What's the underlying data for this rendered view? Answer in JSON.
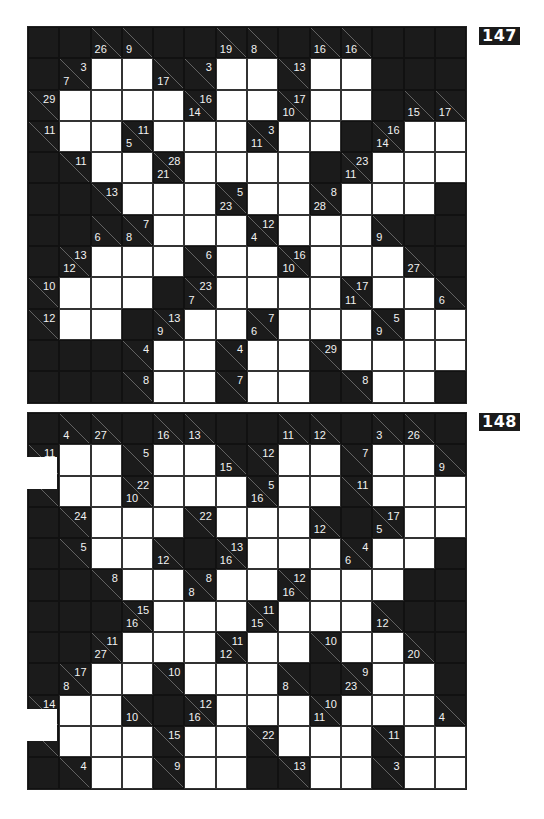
{
  "puzzles": [
    {
      "number": "147",
      "cols": 14,
      "rows": 12,
      "cells": [
        [
          "B",
          "B",
          "26/",
          "9/",
          "B",
          "B",
          "19/",
          "8/",
          "B",
          "16/",
          "16/",
          "B",
          "B",
          "B"
        ],
        [
          "B",
          "7/3",
          "W",
          "W",
          "17/",
          "/3",
          "W",
          "W",
          "/13",
          "W",
          "W",
          "B",
          "B",
          "B"
        ],
        [
          "/29",
          "W",
          "W",
          "W",
          "W",
          "14/16",
          "W",
          "W",
          "10/17",
          "W",
          "W",
          "B",
          "15/",
          "17/"
        ],
        [
          "/11",
          "W",
          "W",
          "5/11",
          "W",
          "W",
          "W",
          "11/3",
          "W",
          "W",
          "B",
          "14/16",
          "W",
          "W"
        ],
        [
          "B",
          "/11",
          "W",
          "W",
          "21/28",
          "W",
          "W",
          "W",
          "W",
          "B",
          "11/23",
          "W",
          "W",
          "W"
        ],
        [
          "B",
          "B",
          "/13",
          "W",
          "W",
          "W",
          "23/5",
          "W",
          "W",
          "28/8",
          "W",
          "W",
          "W",
          "B"
        ],
        [
          "B",
          "B",
          "6/",
          "8/7",
          "W",
          "W",
          "W",
          "4/12",
          "W",
          "W",
          "W",
          "9/",
          "B",
          "B"
        ],
        [
          "B",
          "12/13",
          "W",
          "W",
          "W",
          "/6",
          "W",
          "W",
          "10/16",
          "W",
          "W",
          "W",
          "27/",
          "B"
        ],
        [
          "/10",
          "W",
          "W",
          "W",
          "B",
          "7/23",
          "W",
          "W",
          "W",
          "W",
          "11/17",
          "W",
          "W",
          "6/"
        ],
        [
          "/12",
          "W",
          "W",
          "B",
          "9/13",
          "W",
          "W",
          "6/7",
          "W",
          "W",
          "W",
          "9/5",
          "W",
          "W"
        ],
        [
          "B",
          "B",
          "B",
          "/4",
          "W",
          "W",
          "/4",
          "W",
          "W",
          "/29",
          "W",
          "W",
          "W",
          "W"
        ],
        [
          "B",
          "B",
          "B",
          "/8",
          "W",
          "W",
          "/7",
          "W",
          "W",
          "B",
          "/8",
          "W",
          "W",
          "B"
        ]
      ]
    },
    {
      "number": "148",
      "cols": 14,
      "rows": 12,
      "cells": [
        [
          "B",
          "4/",
          "27/",
          "B",
          "16/",
          "13/",
          "B",
          "B",
          "11/",
          "12/",
          "B",
          "3/",
          "26/",
          "B"
        ],
        [
          "/11",
          "W",
          "W",
          "/5",
          "W",
          "W",
          "15/",
          "/12",
          "W",
          "W",
          "/7",
          "W",
          "W",
          "9/"
        ],
        [
          "/",
          "W",
          "W",
          "10/22",
          "W",
          "W",
          "W",
          "16/5",
          "W",
          "W",
          "/11",
          "W",
          "W",
          "W"
        ],
        [
          "B",
          "/24",
          "W",
          "W",
          "W",
          "/22",
          "W",
          "W",
          "W",
          "12/",
          "B",
          "5/17",
          "W",
          "W"
        ],
        [
          "B",
          "/5",
          "W",
          "W",
          "12/",
          "B",
          "16/13",
          "W",
          "W",
          "W",
          "6/4",
          "W",
          "W",
          "B"
        ],
        [
          "B",
          "B",
          "/8",
          "W",
          "W",
          "8/8",
          "W",
          "W",
          "16/12",
          "W",
          "W",
          "W",
          "B",
          "B"
        ],
        [
          "B",
          "B",
          "B",
          "16/15",
          "W",
          "W",
          "W",
          "15/11",
          "W",
          "W",
          "W",
          "12/",
          "B",
          "B"
        ],
        [
          "B",
          "B",
          "27/11",
          "W",
          "W",
          "W",
          "12/11",
          "W",
          "W",
          "/10",
          "W",
          "W",
          "20/",
          "B"
        ],
        [
          "B",
          "8/17",
          "W",
          "W",
          "/10",
          "W",
          "W",
          "W",
          "8/",
          "B",
          "23/9",
          "W",
          "W",
          "B"
        ],
        [
          "/14",
          "W",
          "W",
          "10/",
          "B",
          "16/12",
          "W",
          "W",
          "W",
          "11/10",
          "W",
          "W",
          "W",
          "4/"
        ],
        [
          "/",
          "W",
          "W",
          "W",
          "/15",
          "W",
          "W",
          "/22",
          "W",
          "W",
          "W",
          "/11",
          "W",
          "W"
        ],
        [
          "B",
          "/4",
          "W",
          "W",
          "/9",
          "W",
          "W",
          "B",
          "/13",
          "W",
          "W",
          "/3",
          "W",
          "W"
        ]
      ]
    }
  ],
  "legend": {
    "cell_codes": {
      "W": "white entry cell",
      "B": "solid black cell",
      "down/across": "clue cell"
    }
  }
}
